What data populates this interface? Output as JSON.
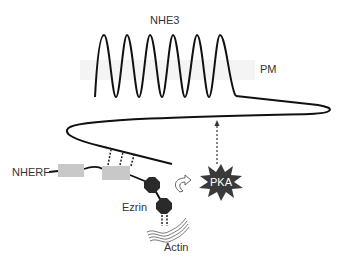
{
  "diagram": {
    "labels": {
      "nhe3": "NHE3",
      "pm": "PM",
      "nherf": "NHERF",
      "ezrin": "Ezrin",
      "actin": "Actin",
      "pka": "PKA"
    },
    "colors": {
      "line": "#111111",
      "pdz_box": "#c8c8c8",
      "ezrin_domain": "#2a2a2a",
      "pka_star": "#3a3a3a",
      "text": "#333333"
    }
  }
}
